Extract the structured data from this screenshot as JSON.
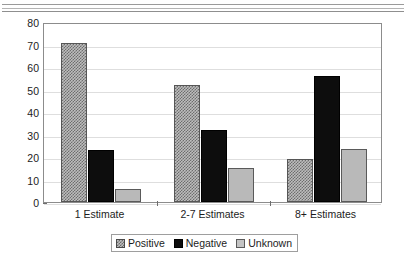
{
  "chart_data": {
    "type": "bar",
    "title": "",
    "xlabel": "",
    "ylabel": "Average percent",
    "ylim": [
      0,
      80
    ],
    "ytick_step": 10,
    "yticks": [
      80,
      70,
      60,
      50,
      40,
      30,
      20,
      10,
      0
    ],
    "grid": true,
    "legend_position": "bottom",
    "categories": [
      "1 Estimate",
      "2-7 Estimates",
      "8+ Estimates"
    ],
    "series": [
      {
        "name": "Positive",
        "values": [
          70.5,
          52.2,
          19.2
        ],
        "color": "#bdbdbd",
        "pattern": "checker-hatch"
      },
      {
        "name": "Negative",
        "values": [
          23.2,
          31.8,
          56.0
        ],
        "color": "#0d0d0d",
        "pattern": "solid"
      },
      {
        "name": "Unknown",
        "values": [
          5.6,
          15.0,
          23.5
        ],
        "color": "#b9b9b9",
        "pattern": "solid-light"
      }
    ]
  },
  "axis": {
    "y_title": "Average percent",
    "y_tick_labels": [
      "80",
      "70",
      "60",
      "50",
      "40",
      "30",
      "20",
      "10",
      "0"
    ],
    "x_tick_labels": [
      "1 Estimate",
      "2-7 Estimates",
      "8+ Estimates"
    ]
  },
  "legend": {
    "entries": [
      {
        "label": "Positive"
      },
      {
        "label": "Negative"
      },
      {
        "label": "Unknown"
      }
    ]
  },
  "decor": {
    "rule_color": "#9a9a9a"
  }
}
